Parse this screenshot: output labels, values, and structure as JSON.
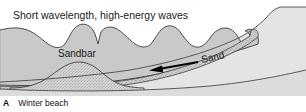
{
  "figure": {
    "title_label": "Short wavelength, high-energy waves",
    "caption_letter": "A",
    "caption_text": "Winter beach",
    "labels": {
      "sandbar": "Sandbar",
      "sand": "Sand"
    },
    "colors": {
      "sky": "#ffffff",
      "water": "#c9c9c9",
      "water_outline": "#3a3a3a",
      "land": "#e4e4e4",
      "land_outline": "#4a4a4a",
      "sand_deposit": "#cccccc",
      "stipple": "#6a6a6a",
      "substrate": "#dcdcdc",
      "text": "#1a1a1a",
      "arrow": "#000000"
    },
    "annotations": {
      "transport_direction": "left",
      "arrow_label": "Sand"
    }
  }
}
